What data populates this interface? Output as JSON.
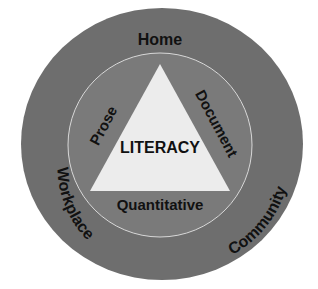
{
  "diagram": {
    "center_label": "LITERACY",
    "triangle_sides": {
      "left": "Prose",
      "right": "Document",
      "bottom": "Quantitative"
    },
    "contexts": {
      "top": "Home",
      "left": "Workplace",
      "right": "Community"
    },
    "colors": {
      "outer_ring": "#6e6e6e",
      "inner_circle": "#7a7a7a",
      "inner_circle_stroke": "#d8d8d8",
      "triangle": "#ececec",
      "text": "#111111"
    }
  }
}
